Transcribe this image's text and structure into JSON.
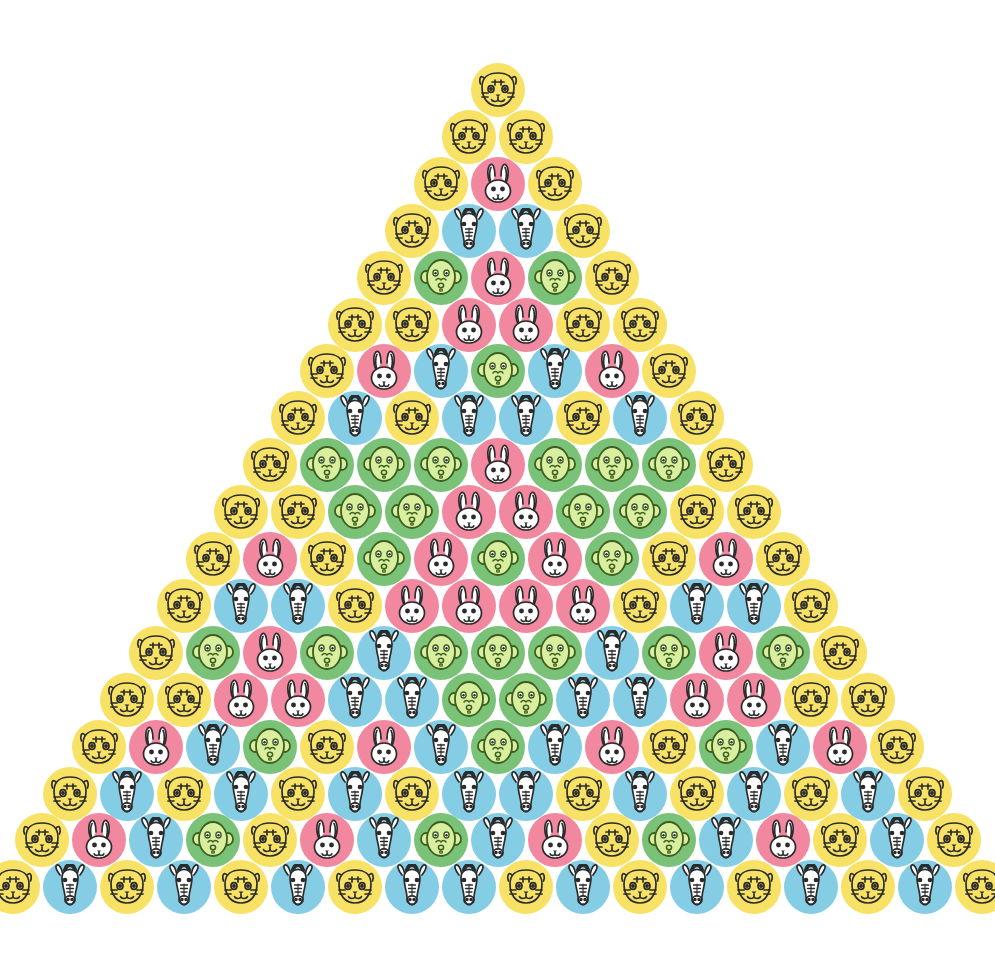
{
  "page": {
    "background_color": "#ffffff",
    "width": 995,
    "height": 960,
    "rows": 18,
    "total_items": 171
  },
  "legend": {
    "species": [
      {
        "key": "tiger",
        "label": "Tiger",
        "color": "#F7E266",
        "icon": "tiger-face-icon"
      },
      {
        "key": "rabbit",
        "label": "Rabbit",
        "color": "#F2889F",
        "icon": "rabbit-face-icon"
      },
      {
        "key": "zebra",
        "label": "Zebra",
        "color": "#84CDE4",
        "icon": "zebra-face-icon"
      },
      {
        "key": "monkey",
        "label": "Monkey",
        "color": "#79C277",
        "icon": "monkey-face-icon"
      }
    ]
  },
  "chart_data": {
    "type": "table",
    "xlabel": "",
    "ylabel": "",
    "categories": [
      "tiger",
      "rabbit",
      "zebra",
      "monkey"
    ],
    "rows": [
      {
        "index": 1,
        "count": 1,
        "cells": [
          "tiger"
        ]
      },
      {
        "index": 2,
        "count": 2,
        "cells": [
          "tiger",
          "tiger"
        ]
      },
      {
        "index": 3,
        "count": 3,
        "cells": [
          "tiger",
          "rabbit",
          "tiger"
        ]
      },
      {
        "index": 4,
        "count": 4,
        "cells": [
          "tiger",
          "zebra",
          "zebra",
          "tiger"
        ]
      },
      {
        "index": 5,
        "count": 5,
        "cells": [
          "tiger",
          "monkey",
          "rabbit",
          "monkey",
          "tiger"
        ]
      },
      {
        "index": 6,
        "count": 6,
        "cells": [
          "tiger",
          "tiger",
          "rabbit",
          "rabbit",
          "tiger",
          "tiger"
        ]
      },
      {
        "index": 7,
        "count": 7,
        "cells": [
          "tiger",
          "rabbit",
          "zebra",
          "monkey",
          "zebra",
          "rabbit",
          "tiger"
        ]
      },
      {
        "index": 8,
        "count": 8,
        "cells": [
          "tiger",
          "zebra",
          "tiger",
          "zebra",
          "zebra",
          "tiger",
          "zebra",
          "tiger"
        ]
      },
      {
        "index": 9,
        "count": 9,
        "cells": [
          "tiger",
          "monkey",
          "monkey",
          "monkey",
          "rabbit",
          "monkey",
          "monkey",
          "monkey",
          "tiger"
        ]
      },
      {
        "index": 10,
        "count": 10,
        "cells": [
          "tiger",
          "tiger",
          "monkey",
          "monkey",
          "rabbit",
          "rabbit",
          "monkey",
          "monkey",
          "tiger",
          "tiger"
        ]
      },
      {
        "index": 11,
        "count": 11,
        "cells": [
          "tiger",
          "rabbit",
          "tiger",
          "monkey",
          "rabbit",
          "monkey",
          "rabbit",
          "monkey",
          "tiger",
          "rabbit",
          "tiger"
        ]
      },
      {
        "index": 12,
        "count": 12,
        "cells": [
          "tiger",
          "zebra",
          "zebra",
          "tiger",
          "rabbit",
          "rabbit",
          "rabbit",
          "rabbit",
          "tiger",
          "zebra",
          "zebra",
          "tiger"
        ]
      },
      {
        "index": 13,
        "count": 13,
        "cells": [
          "tiger",
          "monkey",
          "rabbit",
          "monkey",
          "zebra",
          "monkey",
          "monkey",
          "monkey",
          "zebra",
          "monkey",
          "rabbit",
          "monkey",
          "tiger"
        ]
      },
      {
        "index": 14,
        "count": 14,
        "cells": [
          "tiger",
          "tiger",
          "rabbit",
          "rabbit",
          "zebra",
          "zebra",
          "monkey",
          "monkey",
          "zebra",
          "zebra",
          "rabbit",
          "rabbit",
          "tiger",
          "tiger"
        ]
      },
      {
        "index": 15,
        "count": 15,
        "cells": [
          "tiger",
          "rabbit",
          "zebra",
          "monkey",
          "tiger",
          "rabbit",
          "zebra",
          "monkey",
          "zebra",
          "rabbit",
          "tiger",
          "monkey",
          "zebra",
          "rabbit",
          "tiger"
        ]
      },
      {
        "index": 16,
        "count": 16,
        "cells": [
          "tiger",
          "zebra",
          "tiger",
          "zebra",
          "tiger",
          "zebra",
          "tiger",
          "zebra",
          "zebra",
          "tiger",
          "zebra",
          "tiger",
          "zebra",
          "tiger",
          "zebra",
          "tiger"
        ]
      },
      {
        "index": 17,
        "count": 17,
        "cells": [
          "tiger",
          "rabbit",
          "zebra",
          "monkey",
          "tiger",
          "rabbit",
          "zebra",
          "monkey",
          "zebra",
          "rabbit",
          "tiger",
          "monkey",
          "zebra",
          "rabbit",
          "tiger",
          "zebra",
          "tiger"
        ]
      },
      {
        "index": 18,
        "count": 18,
        "cells": [
          "tiger",
          "zebra",
          "tiger",
          "zebra",
          "tiger",
          "zebra",
          "tiger",
          "zebra",
          "zebra",
          "tiger",
          "zebra",
          "tiger",
          "zebra",
          "tiger",
          "zebra",
          "tiger",
          "zebra",
          "tiger"
        ]
      }
    ],
    "counts": {
      "tiger": 62,
      "rabbit": 33,
      "zebra": 47,
      "monkey": 29
    }
  }
}
